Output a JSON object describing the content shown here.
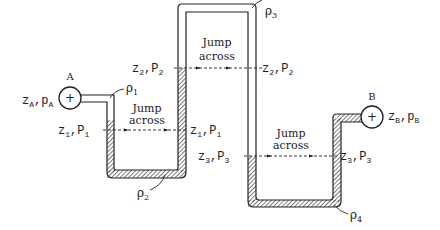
{
  "diagram": {
    "type": "manometer-tube",
    "bulbs": [
      {
        "name": "A",
        "label": "A",
        "sublabel": "zA,pA",
        "z": "z",
        "z_sub": "A",
        "p": "p",
        "p_sub": "A",
        "symbol": "+"
      },
      {
        "name": "B",
        "label": "B",
        "sublabel": "zB,pB",
        "z": "z",
        "z_sub": "B",
        "p": "p",
        "p_sub": "B",
        "symbol": "+"
      }
    ],
    "densities": [
      {
        "label": "ρ",
        "sub": "1"
      },
      {
        "label": "ρ",
        "sub": "2"
      },
      {
        "label": "ρ",
        "sub": "3"
      },
      {
        "label": "ρ",
        "sub": "4"
      }
    ],
    "jumps": [
      {
        "line1": "Jump",
        "line2": "across",
        "left": "z1,P1",
        "right": "z1,P1",
        "z_sub": "1",
        "p_sub": "1"
      },
      {
        "line1": "Jump",
        "line2": "across",
        "left": "z2,P2",
        "right": "z2,P2",
        "z_sub": "2",
        "p_sub": "2"
      },
      {
        "line1": "Jump",
        "line2": "across",
        "left": "z3,P3",
        "right": "z3,P3",
        "z_sub": "3",
        "p_sub": "3"
      }
    ],
    "colors": {
      "ink": "#222222",
      "background": "#ffffff"
    }
  }
}
